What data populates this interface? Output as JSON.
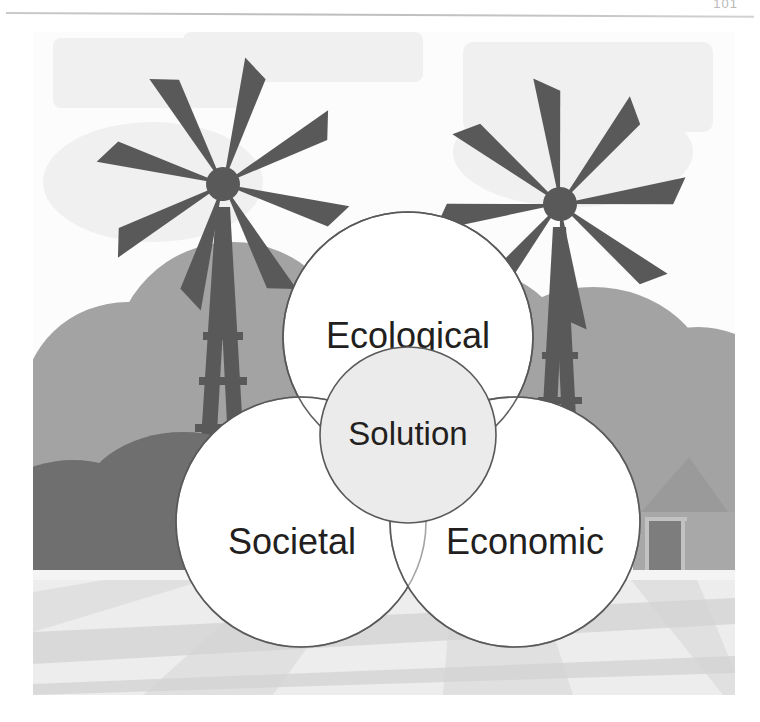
{
  "page": {
    "number": "101"
  },
  "illustration": {
    "name": "sustainability-venn-diagram-farm-scene",
    "scene": {
      "sky_color": "#fcfcfc",
      "cloud_color": "#f0f0f0",
      "bush_mid_color": "#a3a3a3",
      "bush_dark_color": "#6f6f6f",
      "windmill_color": "#595959",
      "barn_color": "#a8a8a8",
      "barn_roof_color": "#9a9a9a",
      "barn_door_color": "#7d7d7d",
      "field_light_color": "#ededed",
      "field_mid_color": "#e0e0e0",
      "field_dark_color": "#d3d3d3",
      "elements": [
        "windmill-left",
        "windmill-right",
        "bushes",
        "barn",
        "field"
      ]
    },
    "venn": {
      "circle_fill": "#ffffff",
      "circle_stroke": "#595959",
      "center_fill": "#ebebeb",
      "label_color": "#231f20",
      "circles": [
        {
          "id": "ecological",
          "label": "Ecological",
          "cx": 375,
          "cy": 305,
          "r": 125
        },
        {
          "id": "societal",
          "label": "Societal",
          "cx": 268,
          "cy": 490,
          "r": 125
        },
        {
          "id": "economic",
          "label": "Economic",
          "cx": 482,
          "cy": 490,
          "r": 125
        },
        {
          "id": "solution",
          "label": "Solution",
          "cx": 375,
          "cy": 403,
          "r": 88
        }
      ]
    }
  }
}
